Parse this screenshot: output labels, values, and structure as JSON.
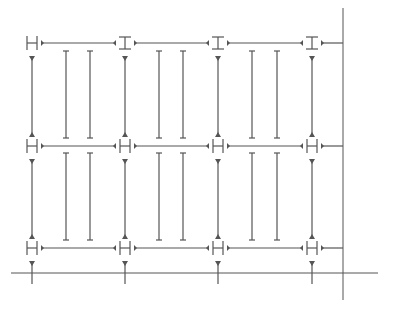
{
  "diagram": {
    "title": "",
    "colors": {
      "line": "#555555",
      "background": "#ffffff"
    },
    "columns_x": [
      32,
      125,
      218,
      312
    ],
    "rows_y": [
      43,
      146,
      248
    ],
    "node_types": [
      [
        "H",
        "I",
        "I",
        "I"
      ],
      [
        "H",
        "H",
        "H",
        "H"
      ],
      [
        "H",
        "H",
        "H",
        "H"
      ]
    ],
    "inner_bars_x": [
      [
        66,
        90
      ],
      [
        159,
        183
      ],
      [
        252,
        277
      ]
    ],
    "inner_bar_spans": [
      [
        51,
        138
      ],
      [
        153,
        240
      ]
    ],
    "axis": {
      "horizontal": {
        "y": 273,
        "x1": 11,
        "x2": 378
      },
      "vertical": {
        "x": 343,
        "y1": 8,
        "y2": 300
      }
    },
    "stub_bottom_y": 284
  }
}
